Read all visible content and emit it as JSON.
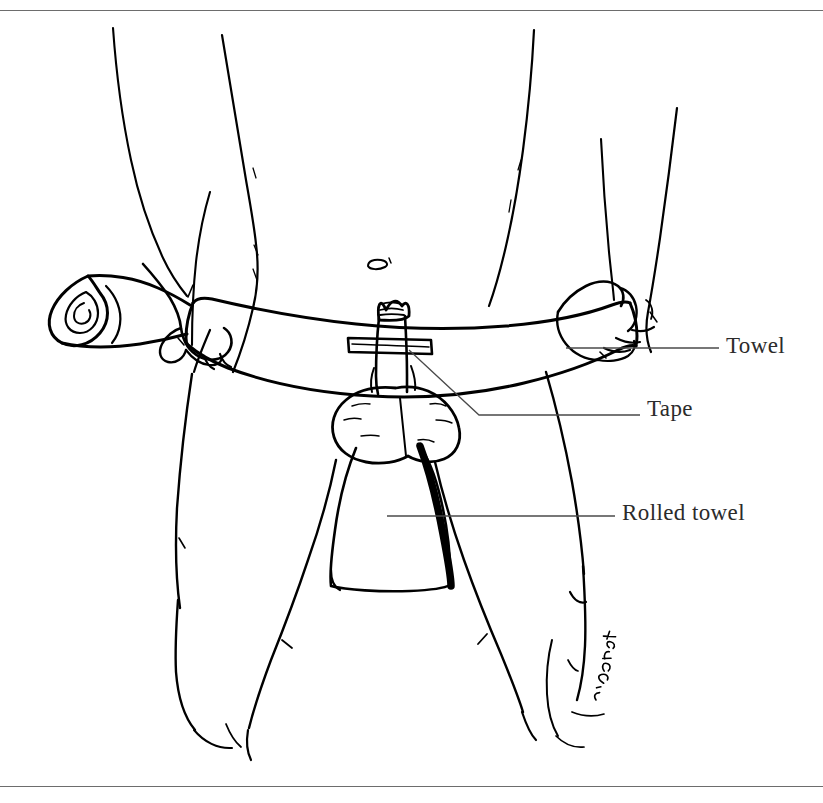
{
  "figure": {
    "kind": "line-drawing",
    "ink_color": "#000000",
    "background_color": "#ffffff",
    "rule_color": "#6d6d6d",
    "signature": "L.K. Stoat"
  },
  "frame": {
    "top_rule_label": "top-border-rule",
    "bottom_rule_label": "bottom-border-rule"
  },
  "labels": [
    {
      "id": "towel",
      "text": "Towel",
      "leader": {
        "x1": 566,
        "y1": 348,
        "x2": 719,
        "y2": 348
      }
    },
    {
      "id": "tape",
      "text": "Tape",
      "leader_segments": [
        {
          "x1": 409,
          "y1": 350,
          "x2": 479,
          "y2": 415
        },
        {
          "x1": 479,
          "y1": 415,
          "x2": 640,
          "y2": 415
        }
      ]
    },
    {
      "id": "rolled_towel",
      "text": "Rolled towel",
      "leader": {
        "x1": 387,
        "y1": 516,
        "x2": 615,
        "y2": 516
      }
    }
  ],
  "parts": {
    "towel_band": "towel-band",
    "tape_strip": "tape-strip",
    "rolled_towel_wedge": "rolled-towel-wedge",
    "left_hand": "left-hand-grip",
    "right_hand": "right-hand-grip",
    "towel_roll_end": "towel-rolled-end-spiral",
    "navel": "navel-mark",
    "left_thigh": "left-thigh",
    "right_thigh": "right-thigh",
    "left_arm": "left-arm",
    "right_arm": "right-arm"
  }
}
